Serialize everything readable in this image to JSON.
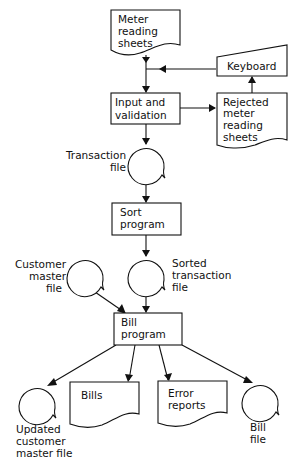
{
  "diagram": {
    "type": "system-flowchart",
    "colors": {
      "stroke": "#111111",
      "background": "#ffffff"
    },
    "nodes": {
      "meter_reading_sheets": {
        "shape": "document",
        "lines": [
          "Meter",
          "reading",
          "sheets"
        ]
      },
      "keyboard": {
        "shape": "manual-input",
        "lines": [
          "Keyboard"
        ]
      },
      "input_validation": {
        "shape": "process",
        "lines": [
          "Input and",
          "validation"
        ]
      },
      "rejected_sheets": {
        "shape": "document",
        "lines": [
          "Rejected",
          "meter",
          "reading",
          "sheets"
        ]
      },
      "transaction_file": {
        "shape": "magnetic-tape",
        "lines": [
          "Transaction",
          "file"
        ]
      },
      "sort_program": {
        "shape": "process",
        "lines": [
          "Sort",
          "program"
        ]
      },
      "customer_master_file": {
        "shape": "magnetic-tape",
        "lines": [
          "Customer",
          "master",
          "file"
        ]
      },
      "sorted_transaction_file": {
        "shape": "magnetic-tape",
        "lines": [
          "Sorted",
          "transaction",
          "file"
        ]
      },
      "bill_program": {
        "shape": "process",
        "lines": [
          "Bill",
          "program"
        ]
      },
      "updated_customer_master_file": {
        "shape": "magnetic-tape",
        "lines": [
          "Updated",
          "customer",
          "master file"
        ]
      },
      "bills": {
        "shape": "document",
        "lines": [
          "Bills"
        ]
      },
      "error_reports": {
        "shape": "document",
        "lines": [
          "Error",
          "reports"
        ]
      },
      "bill_file": {
        "shape": "magnetic-tape",
        "lines": [
          "Bill",
          "file"
        ]
      }
    },
    "edges": [
      {
        "from": "meter_reading_sheets",
        "to": "input_validation"
      },
      {
        "from": "keyboard",
        "to": "input_validation"
      },
      {
        "from": "input_validation",
        "to": "rejected_sheets"
      },
      {
        "from": "rejected_sheets",
        "to": "keyboard"
      },
      {
        "from": "input_validation",
        "to": "transaction_file"
      },
      {
        "from": "transaction_file",
        "to": "sort_program"
      },
      {
        "from": "sort_program",
        "to": "sorted_transaction_file"
      },
      {
        "from": "customer_master_file",
        "to": "bill_program"
      },
      {
        "from": "sorted_transaction_file",
        "to": "bill_program"
      },
      {
        "from": "bill_program",
        "to": "updated_customer_master_file"
      },
      {
        "from": "bill_program",
        "to": "bills"
      },
      {
        "from": "bill_program",
        "to": "error_reports"
      },
      {
        "from": "bill_program",
        "to": "bill_file"
      }
    ]
  }
}
